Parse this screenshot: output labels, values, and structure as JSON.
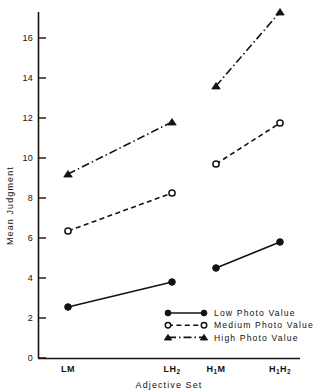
{
  "chart_data": {
    "type": "line",
    "title": "",
    "xlabel": "Adjective Set",
    "ylabel": "Mean Judgment",
    "categories": [
      "LM",
      "LH2",
      "H1M",
      "H1H2"
    ],
    "category_labels": [
      {
        "base": "LM",
        "sub": ""
      },
      {
        "base": "LH",
        "sub": "2"
      },
      {
        "base": "H",
        "sub": "1",
        "base2": "M",
        "sub2": ""
      },
      {
        "base": "H",
        "sub": "1",
        "base2": "H",
        "sub2": "2"
      }
    ],
    "ylim": [
      0,
      18
    ],
    "yticks": [
      0,
      2,
      4,
      6,
      8,
      10,
      12,
      14,
      16
    ],
    "ytick_labels": [
      "0",
      "2",
      "4",
      "6",
      "8",
      "10",
      "12",
      "14",
      "16"
    ],
    "grid": false,
    "legend_position": "lower-right",
    "series": [
      {
        "name": "Low Photo Value",
        "marker": "filled-circle",
        "linestyle": "solid",
        "values": [
          2.55,
          3.8,
          4.5,
          5.8
        ]
      },
      {
        "name": "Medium Photo Value",
        "marker": "open-circle",
        "linestyle": "dashed",
        "values": [
          6.35,
          8.25,
          9.7,
          11.75
        ]
      },
      {
        "name": "High Photo Value",
        "marker": "filled-triangle",
        "linestyle": "dash-dot",
        "values": [
          9.2,
          11.8,
          13.6,
          17.3
        ]
      }
    ],
    "colors": {
      "ink": "#15120f",
      "background": "#ffffff"
    }
  },
  "legend": {
    "items": [
      {
        "label": "Low Photo Value",
        "marker": "filled-circle",
        "linestyle": "solid"
      },
      {
        "label": "Medium Photo Value",
        "marker": "open-circle",
        "linestyle": "dashed"
      },
      {
        "label": "High Photo Value",
        "marker": "filled-triangle",
        "linestyle": "dash-dot"
      }
    ]
  }
}
